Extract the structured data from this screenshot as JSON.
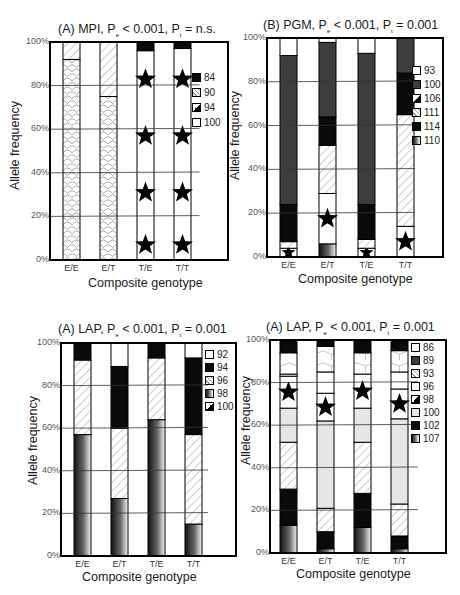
{
  "chart_data": [
    {
      "type": "bar",
      "stacked": true,
      "title": "(A) MPI, Pe < 0.001, Pt = n.s.",
      "title_parts": {
        "prefix": "(A) MPI, P",
        "sub1": "e",
        "mid": " < 0.001, P",
        "sub2": "t",
        "suffix": " = n.s."
      },
      "xlabel": "Composite genotype",
      "ylabel": "Allele frequency",
      "ylim": [
        0,
        100
      ],
      "yticks": [
        "0%",
        "20%",
        "40%",
        "60%",
        "80%",
        "100%"
      ],
      "grid": true,
      "legend_position": "right",
      "categories": [
        "E/E",
        "E/T",
        "T/E",
        "T/T"
      ],
      "legend": [
        "84",
        "90",
        "94",
        "100"
      ],
      "series": [
        {
          "name": "90",
          "pattern": "scales",
          "values": [
            92,
            75,
            0,
            0
          ]
        },
        {
          "name": "94",
          "pattern": "star",
          "values": [
            0,
            0,
            0,
            0
          ]
        },
        {
          "name": "100",
          "pattern": "star-white",
          "values": [
            0,
            0,
            96,
            97
          ]
        },
        {
          "name": "84",
          "pattern": "black",
          "values": [
            0,
            0,
            4,
            3
          ]
        },
        {
          "name": "90-top",
          "pattern": "hatch",
          "values": [
            8,
            25,
            0,
            0
          ]
        }
      ]
    },
    {
      "type": "bar",
      "stacked": true,
      "title": "(B) PGM, Pe < 0.001, Pt = 0.001",
      "title_parts": {
        "prefix": "(B) PGM, P",
        "sub1": "e",
        "mid": " < 0.001, P",
        "sub2": "t",
        "suffix": " = 0.001"
      },
      "xlabel": "Composite genotype",
      "ylabel": "Allele frequency",
      "ylim": [
        0,
        100
      ],
      "yticks": [
        "0%",
        "20%",
        "40%",
        "60%",
        "80%",
        "100%"
      ],
      "grid": true,
      "legend_position": "right",
      "categories": [
        "E/E",
        "E/T",
        "T/E",
        "T/T"
      ],
      "legend": [
        "93",
        "100",
        "106",
        "111",
        "114",
        "110"
      ],
      "series": [
        {
          "name": "110",
          "pattern": "gradient",
          "values": [
            0,
            6,
            0,
            0
          ]
        },
        {
          "name": "106",
          "pattern": "star",
          "values": [
            4,
            23,
            4,
            14
          ]
        },
        {
          "name": "111",
          "pattern": "hatch",
          "values": [
            3,
            22,
            4,
            51
          ]
        },
        {
          "name": "114",
          "pattern": "black",
          "values": [
            17,
            13,
            16,
            19
          ]
        },
        {
          "name": "100",
          "pattern": "darkgray",
          "values": [
            68,
            34,
            69,
            16
          ]
        },
        {
          "name": "93",
          "pattern": "white",
          "values": [
            8,
            2,
            7,
            0
          ]
        }
      ]
    },
    {
      "type": "bar",
      "stacked": true,
      "title": "(A) LAP, Pe < 0.001, Pt = 0.001",
      "title_parts": {
        "prefix": "(A) LAP, P",
        "sub1": "e",
        "mid": " < 0.001, P",
        "sub2": "t",
        "suffix": " = 0.001"
      },
      "xlabel": "Composite genotype",
      "ylabel": "Allele frequency",
      "ylim": [
        0,
        100
      ],
      "yticks": [
        "0%",
        "20%",
        "40%",
        "60%",
        "80%",
        "100%"
      ],
      "grid": true,
      "legend_position": "right",
      "categories": [
        "E/E",
        "E/T",
        "T/E",
        "T/T"
      ],
      "legend": [
        "92",
        "94",
        "96",
        "98",
        "100"
      ],
      "series": [
        {
          "name": "98",
          "pattern": "gradient",
          "values": [
            57,
            27,
            64,
            15
          ]
        },
        {
          "name": "96",
          "pattern": "hatch",
          "values": [
            35,
            33,
            29,
            42
          ]
        },
        {
          "name": "94",
          "pattern": "black",
          "values": [
            8,
            29,
            7,
            36
          ]
        },
        {
          "name": "92",
          "pattern": "white",
          "values": [
            0,
            11,
            0,
            7
          ]
        }
      ]
    },
    {
      "type": "bar",
      "stacked": true,
      "title": "(A) LAP, Pe < 0.001, Pt = 0.001",
      "title_parts": {
        "prefix": "(A) LAP, P",
        "sub1": "e",
        "mid": " < 0.001, P",
        "sub2": "t",
        "suffix": " = 0.001"
      },
      "xlabel": "Composite genotype",
      "ylabel": "Allele frequency",
      "ylim": [
        0,
        100
      ],
      "yticks": [
        "0%",
        "20%",
        "40%",
        "60%",
        "80%",
        "100%"
      ],
      "grid": true,
      "legend_position": "right",
      "categories": [
        "E/E",
        "E/T",
        "T/E",
        "T/T"
      ],
      "legend": [
        "86",
        "89",
        "93",
        "96",
        "98",
        "100",
        "102",
        "107"
      ],
      "series": [
        {
          "name": "107",
          "pattern": "gradient",
          "values": [
            13,
            2,
            12,
            2
          ]
        },
        {
          "name": "102",
          "pattern": "black",
          "values": [
            17,
            8,
            16,
            6
          ]
        },
        {
          "name": "93",
          "pattern": "hatch",
          "values": [
            22,
            11,
            24,
            15
          ]
        },
        {
          "name": "100",
          "pattern": "lightgray",
          "values": [
            16,
            41,
            16,
            40
          ]
        },
        {
          "name": "98",
          "pattern": "star",
          "values": [
            15,
            13,
            16,
            14
          ]
        },
        {
          "name": "96",
          "pattern": "white",
          "values": [
            1,
            10,
            0,
            8
          ]
        },
        {
          "name": "86",
          "pattern": "hex",
          "values": [
            10,
            12,
            10,
            10
          ]
        },
        {
          "name": "89",
          "pattern": "black",
          "values": [
            6,
            3,
            6,
            5
          ]
        }
      ]
    }
  ],
  "legend_swatches": {
    "0": [
      "black",
      "hatch",
      "star",
      "white"
    ],
    "1": [
      "white",
      "darkgray",
      "star",
      "hatch",
      "black",
      "gradient"
    ],
    "2": [
      "white",
      "black",
      "hatch",
      "gradient",
      "star"
    ],
    "3": [
      "white",
      "darkgray",
      "hatch",
      "white",
      "star",
      "lightgray",
      "black",
      "gradient"
    ]
  },
  "colors": {
    "black": "#0a0a0a",
    "darkgray": "#3d3d3d",
    "lightgray": "#e6e6e6",
    "white": "#ffffff",
    "grid": "#333333"
  }
}
